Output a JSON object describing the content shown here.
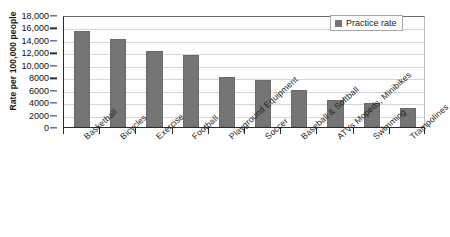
{
  "chart_data": {
    "type": "bar",
    "title": "",
    "xlabel": "",
    "ylabel": "Rate per 100,000 people",
    "ylim": [
      0,
      18000
    ],
    "ytick_step": 2000,
    "grid": true,
    "legend_position": "top-right",
    "categories": [
      "Basketball",
      "Bicycles",
      "Exercise",
      "Football",
      "Playground Equipment",
      "Soccer",
      "Baseball & Softball",
      "ATVs Mopeds, Minibikes",
      "Swimming",
      "Trampolines"
    ],
    "series": [
      {
        "name": "Practice rate",
        "color": "#757575",
        "values": [
          15400,
          14200,
          12200,
          11600,
          8000,
          7600,
          5900,
          4400,
          3900,
          3100
        ]
      }
    ],
    "ytick_labels": [
      "0",
      "2000",
      "4000",
      "6000",
      "8000",
      "10,000",
      "12,000",
      "14,000",
      "16,000",
      "18,000"
    ],
    "ytick_values": [
      0,
      2000,
      4000,
      6000,
      8000,
      10000,
      12000,
      14000,
      16000,
      18000
    ]
  },
  "legend": {
    "entries": [
      {
        "label": "Practice rate",
        "color": "#757575"
      }
    ]
  },
  "colors": {
    "bar": "#757575",
    "axis": "#2b2b2b",
    "gridline": "#d6d6d6",
    "text": "#1a1a1a",
    "background": "#ffffff"
  }
}
